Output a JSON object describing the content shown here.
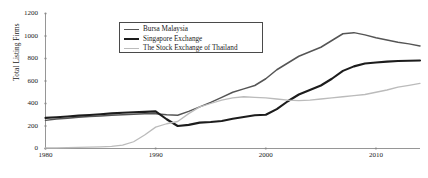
{
  "chart_data": {
    "type": "line",
    "title": "",
    "xlabel": "",
    "ylabel": "Total Listing Firms",
    "xlim": [
      1980,
      2014
    ],
    "ylim": [
      0,
      1200
    ],
    "grid": false,
    "legend_position": "top-center-left",
    "xticks": [
      "1980",
      "1990",
      "2000",
      "2010"
    ],
    "xtick_values": [
      1980,
      1990,
      2000,
      2010
    ],
    "yticks": [
      "0",
      "200",
      "400",
      "600",
      "800",
      "1000",
      "1200"
    ],
    "ytick_values": [
      0,
      200,
      400,
      600,
      800,
      1000,
      1200
    ],
    "x": [
      1980,
      1981,
      1982,
      1983,
      1984,
      1985,
      1986,
      1987,
      1988,
      1989,
      1990,
      1991,
      1992,
      1993,
      1994,
      1995,
      1996,
      1997,
      1998,
      1999,
      2000,
      2001,
      2002,
      2003,
      2004,
      2005,
      2006,
      2007,
      2008,
      2009,
      2010,
      2011,
      2012,
      2013,
      2014
    ],
    "series": [
      {
        "name": "Bursa Malaysia",
        "color": "#555555",
        "width": 1.5,
        "values": [
          250,
          262,
          270,
          278,
          284,
          290,
          295,
          300,
          305,
          308,
          310,
          300,
          295,
          330,
          370,
          410,
          455,
          500,
          530,
          560,
          620,
          700,
          760,
          820,
          860,
          900,
          960,
          1020,
          1030,
          1010,
          985,
          965,
          945,
          930,
          912
        ]
      },
      {
        "name": "Singapore Exchange",
        "color": "#1c1c1c",
        "width": 2.1,
        "values": [
          272,
          278,
          285,
          292,
          298,
          305,
          312,
          318,
          322,
          326,
          330,
          260,
          200,
          210,
          230,
          235,
          245,
          265,
          280,
          295,
          300,
          350,
          420,
          480,
          520,
          560,
          620,
          690,
          730,
          755,
          765,
          772,
          778,
          780,
          782
        ]
      },
      {
        "name": "The Stock Exchange of Thailand",
        "color": "#bbbbbb",
        "width": 1.3,
        "values": [
          5,
          6,
          8,
          10,
          12,
          14,
          18,
          30,
          60,
          120,
          190,
          220,
          240,
          310,
          370,
          400,
          430,
          450,
          460,
          455,
          450,
          440,
          430,
          425,
          430,
          440,
          450,
          460,
          470,
          480,
          500,
          520,
          545,
          562,
          578
        ]
      }
    ]
  },
  "legend": {
    "items": [
      {
        "label": "Bursa Malaysia",
        "color": "#555555",
        "thickness": "1.5px"
      },
      {
        "label": "Singapore Exchange",
        "color": "#1c1c1c",
        "thickness": "2.1px"
      },
      {
        "label": "The Stock Exchange of Thailand",
        "color": "#bbbbbb",
        "thickness": "1.3px"
      }
    ]
  },
  "axes": {
    "y_title": "Total Listing Firms",
    "axis_color": "#8a8a8a"
  }
}
